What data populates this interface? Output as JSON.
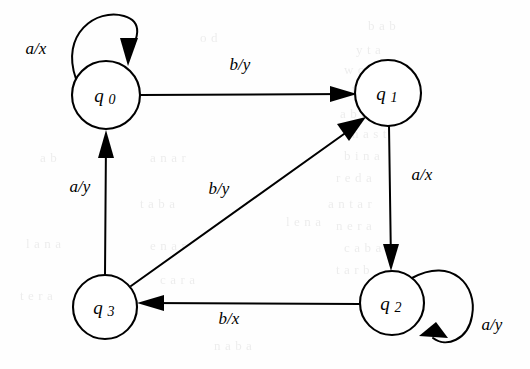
{
  "figure": {
    "kind": "finite-state-transducer-diagram",
    "caption": "",
    "background_color": "#fefefe",
    "ink_color": "#000000"
  },
  "states": [
    {
      "id": "q0",
      "label": "q",
      "subscript": "0",
      "cx": 106,
      "cy": 95,
      "r": 34
    },
    {
      "id": "q1",
      "label": "q",
      "subscript": "1",
      "cx": 388,
      "cy": 93,
      "r": 33
    },
    {
      "id": "q2",
      "label": "q",
      "subscript": "2",
      "cx": 392,
      "cy": 303,
      "r": 32
    },
    {
      "id": "q3",
      "label": "q",
      "subscript": "3",
      "cx": 105,
      "cy": 307,
      "r": 32
    }
  ],
  "transitions": [
    {
      "id": "t-q0-q0",
      "from": "q0",
      "to": "q0",
      "input": "a",
      "output": "x",
      "label": "a/x",
      "label_x": 36,
      "label_y": 54,
      "kind": "self-loop"
    },
    {
      "id": "t-q0-q1",
      "from": "q0",
      "to": "q1",
      "input": "b",
      "output": "y",
      "label": "b/y",
      "label_x": 240,
      "label_y": 70,
      "kind": "straight"
    },
    {
      "id": "t-q1-q2",
      "from": "q1",
      "to": "q2",
      "input": "a",
      "output": "x",
      "label": "a/x",
      "label_x": 422,
      "label_y": 180,
      "kind": "straight"
    },
    {
      "id": "t-q2-q3",
      "from": "q2",
      "to": "q3",
      "input": "b",
      "output": "x",
      "label": "b/x",
      "label_x": 229,
      "label_y": 324,
      "kind": "straight"
    },
    {
      "id": "t-q2-q2",
      "from": "q2",
      "to": "q2",
      "input": "a",
      "output": "y",
      "label": "a/y",
      "label_x": 492,
      "label_y": 330,
      "kind": "self-loop"
    },
    {
      "id": "t-q3-q0",
      "from": "q3",
      "to": "q0",
      "input": "a",
      "output": "y",
      "label": "a/y",
      "label_x": 80,
      "label_y": 192,
      "kind": "straight"
    },
    {
      "id": "t-q3-q1",
      "from": "q3",
      "to": "q1",
      "input": "b",
      "output": "y",
      "label": "b/y",
      "label_x": 219,
      "label_y": 194,
      "kind": "diagonal"
    }
  ],
  "alphabet": {
    "inputs": [
      "a",
      "b"
    ],
    "outputs": [
      "x",
      "y"
    ]
  },
  "bleed_through_text": [
    {
      "text": "b a b",
      "x": 368,
      "y": 18
    },
    {
      "text": "y t a",
      "x": 356,
      "y": 42
    },
    {
      "text": "w c n",
      "x": 344,
      "y": 62
    },
    {
      "text": "b a b",
      "x": 352,
      "y": 84
    },
    {
      "text": "a b c a",
      "x": 340,
      "y": 106
    },
    {
      "text": "n a s t",
      "x": 352,
      "y": 126
    },
    {
      "text": "b i n a",
      "x": 344,
      "y": 148
    },
    {
      "text": "r e d a",
      "x": 336,
      "y": 170
    },
    {
      "text": "a n t a r",
      "x": 328,
      "y": 196
    },
    {
      "text": "n e r a",
      "x": 336,
      "y": 218
    },
    {
      "text": "c a b a",
      "x": 344,
      "y": 240
    },
    {
      "text": "t a r b",
      "x": 336,
      "y": 262
    },
    {
      "text": "l e n a",
      "x": 286,
      "y": 214
    },
    {
      "text": "a n a r",
      "x": 150,
      "y": 150
    },
    {
      "text": "t a b a",
      "x": 140,
      "y": 196
    },
    {
      "text": "e n a r",
      "x": 150,
      "y": 238
    },
    {
      "text": "c a r a",
      "x": 160,
      "y": 272
    },
    {
      "text": "n a b a",
      "x": 214,
      "y": 338
    },
    {
      "text": "l a n a",
      "x": 26,
      "y": 236
    },
    {
      "text": "t e r a",
      "x": 20,
      "y": 288
    },
    {
      "text": "a b",
      "x": 40,
      "y": 150
    },
    {
      "text": "o d",
      "x": 200,
      "y": 30
    }
  ]
}
